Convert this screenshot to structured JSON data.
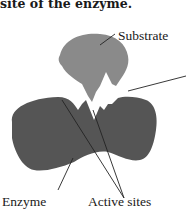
{
  "caption": "site of the enzyme.",
  "labels": {
    "substrate": "Substrate",
    "enzyme": "Enzyme",
    "active_sites": "Active sites"
  },
  "colors": {
    "substrate": "#8a8a8a",
    "enzyme": "#555555",
    "leader_line": "#222222",
    "text": "#1a1a1a"
  }
}
